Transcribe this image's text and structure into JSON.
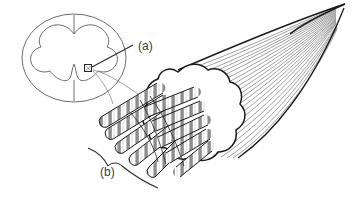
{
  "figure": {
    "kind": "line-art anatomical diagram",
    "background_color": "#ffffff",
    "ink_color": "#1a1a1a",
    "light_ink_color": "#6e6e6e",
    "label_color": "#3b3b3b",
    "width": 352,
    "height": 202
  },
  "labels": {
    "a": "(a)",
    "b": "(b)"
  },
  "cross_section": {
    "name": "spinal-cord-cross-section",
    "outline_shape": "oval",
    "gray_matter_shape": "butterfly",
    "posterior_median_sulcus": "vertical notch at top",
    "anterior_median_fissure": "vertical cleft at bottom",
    "callout_marker": "small square in ventral horn"
  },
  "nerve_bundle": {
    "name": "nerve-fiber-bundle",
    "body_shape": "lobed rounded mass",
    "fiber_count_radiating": 10,
    "fiber_pattern": "banded myelinated segments",
    "fascicle_direction": "tapering to a point toward upper right",
    "fascicle_line_count": 34
  },
  "bracket": {
    "name": "bracket-b",
    "style": "curved brace beneath radiating fibers"
  }
}
